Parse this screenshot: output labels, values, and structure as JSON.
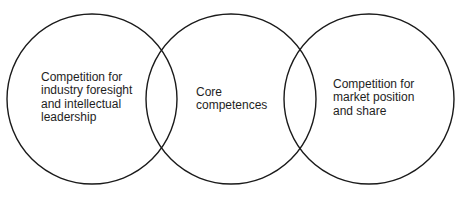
{
  "diagram": {
    "type": "venn",
    "stroke_color": "#1a1a1a",
    "background_color": "#ffffff",
    "circles": [
      {
        "id": "foresight",
        "cx": 92,
        "cy": 99,
        "r": 85,
        "label_lines": [
          "Competition for",
          "industry foresight",
          "and intellectual",
          "leadership"
        ]
      },
      {
        "id": "core",
        "cx": 231,
        "cy": 99,
        "r": 85,
        "label_lines": [
          "Core",
          "competences"
        ]
      },
      {
        "id": "market",
        "cx": 369,
        "cy": 99,
        "r": 85,
        "label_lines": [
          "Competition for",
          "market position",
          "and share"
        ]
      }
    ]
  }
}
